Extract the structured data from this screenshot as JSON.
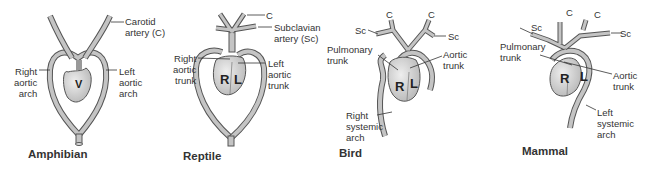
{
  "panels": [
    {
      "title": "Amphibian",
      "chambers": [
        "V"
      ],
      "labels": {
        "carotid": "Carotid\nartery (C)",
        "right_arch": "Right\naortic\narch",
        "left_arch": "Left\naortic\narch"
      }
    },
    {
      "title": "Reptile",
      "chambers": [
        "R",
        "L"
      ],
      "labels": {
        "c": "C",
        "subclavian": "Subclavian\nartery (Sc)",
        "right_trunk": "Right\naortic\ntrunk",
        "left_trunk": "Left\naortic\ntrunk"
      }
    },
    {
      "title": "Bird",
      "chambers": [
        "R",
        "L"
      ],
      "labels": {
        "c_left": "C",
        "c_right": "C",
        "sc_left": "Sc",
        "sc_right": "Sc",
        "pulmonary": "Pulmonary\ntrunk",
        "aortic": "Aortic\ntrunk",
        "right_systemic": "Right\nsystemic\narch"
      }
    },
    {
      "title": "Mammal",
      "chambers": [
        "R",
        "L"
      ],
      "labels": {
        "c_left": "C",
        "c_right": "C",
        "sc_left": "Sc",
        "sc_right": "Sc",
        "pulmonary": "Pulmonary\ntrunk",
        "aortic": "Aortic\ntrunk",
        "left_systemic": "Left\nsystemic\narch"
      }
    }
  ],
  "colors": {
    "vessel": "#bdbdbd",
    "vessel_edge": "#555555",
    "heart": "#d6d6d6",
    "text": "#333333"
  }
}
